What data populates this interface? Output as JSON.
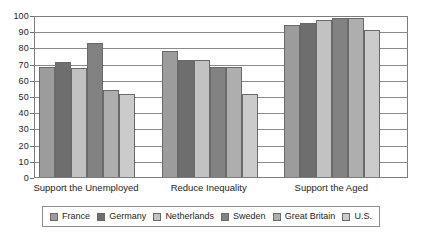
{
  "chart_data": {
    "type": "bar",
    "title": "",
    "subtitle": "",
    "xlabel": "",
    "ylabel": "",
    "ylim": [
      0,
      100
    ],
    "ytick_values": [
      100,
      90,
      80,
      70,
      60,
      50,
      40,
      30,
      20,
      10,
      0
    ],
    "ytick_labels": [
      "100",
      "90",
      "80",
      "70",
      "60",
      "50",
      "40",
      "30",
      "20",
      "10",
      "0"
    ],
    "grid": true,
    "grid_axis": "y",
    "legend_position": "bottom",
    "categories": [
      "Support the Unemployed",
      "Reduce Inequality",
      "Support the Aged"
    ],
    "series": [
      {
        "name": "France",
        "color": "#9c9c9c",
        "values": [
          68,
          78,
          94
        ]
      },
      {
        "name": "Germany",
        "color": "#6e6e6e",
        "values": [
          71,
          72,
          95
        ]
      },
      {
        "name": "Netherlands",
        "color": "#c2c2c2",
        "values": [
          67,
          72,
          97
        ]
      },
      {
        "name": "Sweden",
        "color": "#828282",
        "values": [
          83,
          68,
          98
        ]
      },
      {
        "name": "Great Britain",
        "color": "#aeaeae",
        "values": [
          54,
          68,
          98
        ]
      },
      {
        "name": "U.S.",
        "color": "#cbcbcb",
        "values": [
          51,
          51,
          91
        ]
      }
    ]
  }
}
